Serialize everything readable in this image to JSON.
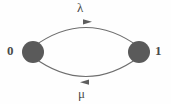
{
  "diagram": {
    "type": "state-transition-diagram",
    "background_color": "#fefefe",
    "node_fill_color": "#5a5a5a",
    "edge_color": "#6e6e6e",
    "text_color": "#4a4a4a",
    "states": [
      {
        "id": "0",
        "label": "0",
        "cx": 33,
        "cy": 52,
        "r": 11
      },
      {
        "id": "1",
        "label": "1",
        "cx": 139,
        "cy": 52,
        "r": 11
      }
    ],
    "transitions": [
      {
        "id": "zero-to-one",
        "from": "0",
        "to": "1",
        "label": "λ",
        "label_name": "lambda",
        "direction": "right",
        "position": "top",
        "arrow_x": 89,
        "arrow_y": 22
      },
      {
        "id": "one-to-zero",
        "from": "1",
        "to": "0",
        "label": "μ",
        "label_name": "mu",
        "direction": "left",
        "position": "bottom",
        "arrow_x": 84,
        "arrow_y": 82
      }
    ]
  }
}
